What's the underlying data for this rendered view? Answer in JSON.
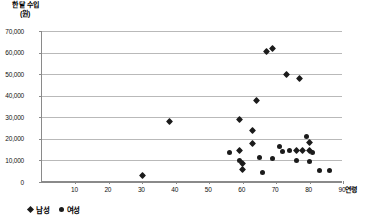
{
  "chart_data": {
    "type": "scatter",
    "title": "",
    "xlabel": "연령",
    "ylabel": "한 달 수입",
    "ylabel_unit": "(원)",
    "xlim": [
      0,
      90
    ],
    "ylim": [
      0,
      70000
    ],
    "xticks": [
      10,
      20,
      30,
      40,
      50,
      60,
      70,
      80,
      90
    ],
    "xtick_labels": [
      "10",
      "20",
      "30",
      "40",
      "50",
      "60",
      "70",
      "80",
      "90"
    ],
    "yticks": [
      0,
      10000,
      20000,
      30000,
      40000,
      50000,
      60000,
      70000
    ],
    "ytick_labels": [
      "0",
      "10,000",
      "20,000",
      "30,000",
      "40,000",
      "50,000",
      "60,000",
      "70,000"
    ],
    "grid": "horizontal",
    "legend_position": "bottom-left",
    "marker_color": "#1b1b1b",
    "grid_color": "#b9b9b9",
    "axis_color": "#8a8a8a",
    "series": [
      {
        "name": "남성",
        "marker": "diamond",
        "points": [
          [
            30,
            3000
          ],
          [
            38,
            28000
          ],
          [
            59,
            29000
          ],
          [
            63,
            24000
          ],
          [
            64,
            38000
          ],
          [
            67,
            60500
          ],
          [
            69,
            62000
          ],
          [
            59,
            14500
          ],
          [
            60,
            8500
          ],
          [
            60,
            6000
          ],
          [
            63,
            18000
          ],
          [
            73,
            50000
          ],
          [
            77,
            48000
          ],
          [
            76,
            14500
          ],
          [
            78,
            14500
          ],
          [
            80,
            18500
          ],
          [
            80,
            14500
          ]
        ]
      },
      {
        "name": "여성",
        "marker": "circle",
        "points": [
          [
            56,
            13500
          ],
          [
            59,
            10000
          ],
          [
            65,
            11500
          ],
          [
            69,
            11000
          ],
          [
            71,
            16500
          ],
          [
            72,
            14000
          ],
          [
            74,
            14500
          ],
          [
            76,
            10000
          ],
          [
            79,
            21000
          ],
          [
            80,
            9500
          ],
          [
            81,
            13500
          ],
          [
            83,
            5500
          ],
          [
            86,
            5500
          ],
          [
            66,
            4500
          ]
        ]
      }
    ]
  },
  "legend": {
    "items": [
      {
        "label": "남성",
        "marker": "diamond"
      },
      {
        "label": "여성",
        "marker": "circle"
      }
    ]
  }
}
